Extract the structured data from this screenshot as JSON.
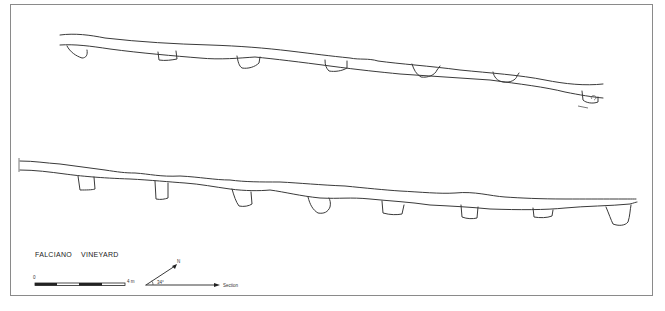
{
  "drawing": {
    "title": "FALCIANO    VINEYARD",
    "site": "FALCIANO",
    "label": "VINEYARD"
  },
  "scale_bar": {
    "start_label": "0",
    "end_label": "4 m",
    "segments": 4
  },
  "orientation": {
    "north_label": "N",
    "angle_label": "34°",
    "section_label": "Section"
  },
  "profiles": [
    {
      "name": "upper-section",
      "cuts": 8
    },
    {
      "name": "lower-section",
      "cuts": 9
    }
  ],
  "colors": {
    "line": "#3a3a3a",
    "frame": "#8a8a8a",
    "background": "#ffffff"
  }
}
